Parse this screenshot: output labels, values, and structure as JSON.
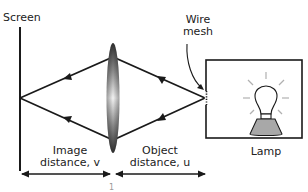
{
  "diagram": {
    "labels": {
      "screen": "Screen",
      "wire_mesh_line1": "Wire",
      "wire_mesh_line2": "mesh",
      "image_distance_line1": "Image",
      "image_distance_line2": "distance, v",
      "object_distance_line1": "Object",
      "object_distance_line2": "distance, u",
      "lamp": "Lamp",
      "cutoff_text": "1"
    },
    "colors": {
      "stroke": "#1a1a1a",
      "lamp_base": "#a8a8a8",
      "bulb_rays": "#b0b0b0",
      "lens_dark": "#3a3a3a",
      "lens_light": "#f2f2f2"
    },
    "elements": [
      "screen",
      "converging lens",
      "wire mesh",
      "lamp in box",
      "light rays",
      "distance arrows"
    ]
  }
}
